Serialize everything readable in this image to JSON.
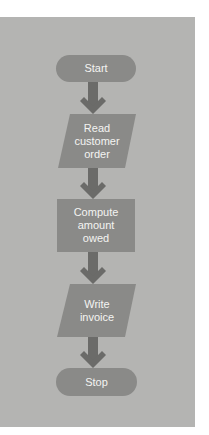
{
  "diagram": {
    "type": "flowchart",
    "colors": {
      "background": "#b4b4b2",
      "shape_fill": "#8a8a88",
      "arrow": "#6b6b69",
      "text": "#f4f4f2"
    },
    "nodes": [
      {
        "id": "start",
        "shape": "terminal",
        "label": "Start"
      },
      {
        "id": "read",
        "shape": "parallelogram",
        "label": "Read\ncustomer\norder"
      },
      {
        "id": "compute",
        "shape": "rectangle",
        "label": "Compute\namount\nowed"
      },
      {
        "id": "write",
        "shape": "parallelogram",
        "label": "Write\ninvoice"
      },
      {
        "id": "stop",
        "shape": "terminal",
        "label": "Stop"
      }
    ],
    "edges": [
      {
        "from": "start",
        "to": "read"
      },
      {
        "from": "read",
        "to": "compute"
      },
      {
        "from": "compute",
        "to": "write"
      },
      {
        "from": "write",
        "to": "stop"
      }
    ]
  }
}
